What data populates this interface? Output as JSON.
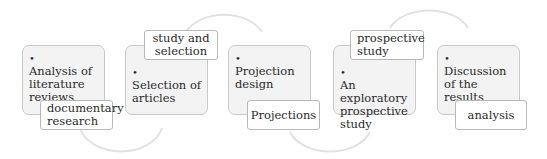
{
  "diagram": {
    "steps": [
      {
        "main": "Analysis of literature reviews",
        "sub": "documentary research"
      },
      {
        "main": "Selection of articles",
        "sub": "study and selection"
      },
      {
        "main": "Projection design",
        "sub": "Projections"
      },
      {
        "main": "An exploratory prospective study",
        "sub": "prospective study"
      },
      {
        "main": "Discussion of the results",
        "sub": "analysis"
      }
    ],
    "bullet": "•",
    "colors": {
      "box_fill": "#f3f3f3",
      "box_border": "#c9c9c9",
      "arc": "#e0e0e0",
      "text": "#2a2a2a"
    }
  }
}
